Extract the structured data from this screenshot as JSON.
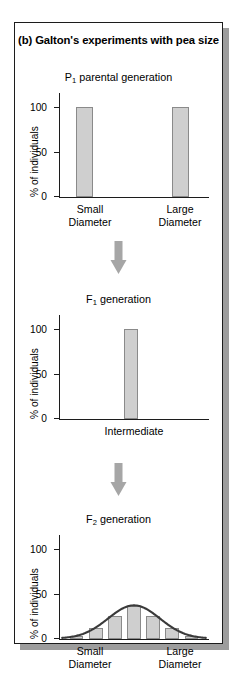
{
  "figure": {
    "title": "(b) Galton's experiments with pea size",
    "title_prefix": "(b)",
    "title_text": "Galton's experiments with pea size"
  },
  "axis": {
    "y_label": "% of individuals",
    "y_ticks": [
      "100",
      "50",
      "0"
    ],
    "y_min": 0,
    "y_max": 115
  },
  "panels": [
    {
      "id": "p1",
      "generation_label_prefix": "P",
      "generation_label_sub": "1",
      "generation_label_suffix": " parental generation",
      "x_categories": [
        "Small\nDiameter",
        "Large\nDiameter"
      ],
      "bar_values": [
        100,
        100
      ]
    },
    {
      "id": "f1",
      "generation_label_prefix": "F",
      "generation_label_sub": "1",
      "generation_label_suffix": " generation",
      "x_categories": [
        "Intermediate"
      ],
      "bar_values": [
        100
      ]
    },
    {
      "id": "f2",
      "generation_label_prefix": "F",
      "generation_label_sub": "2",
      "generation_label_suffix": " generation",
      "x_categories": [
        "Small\nDiameter",
        "Large\nDiameter"
      ],
      "bar_values": [
        3,
        14,
        29,
        41,
        29,
        14,
        3
      ]
    }
  ],
  "colors": {
    "bar_fill": "#cfcfcf",
    "bar_stroke": "#8a8a8a",
    "arrow": "#a6a6a6",
    "axis": "#1c1c1c",
    "curve": "#3a3a3a",
    "frame": "#1c1c1c",
    "shadow": "#9d9d9d"
  },
  "chart_data": [
    {
      "type": "bar",
      "title": "P1 parental generation",
      "xlabel": "",
      "ylabel": "% of individuals",
      "categories": [
        "Small Diameter",
        "Large Diameter"
      ],
      "values": [
        100,
        100
      ],
      "ylim": [
        0,
        115
      ],
      "yticks": [
        0,
        50,
        100
      ],
      "grid": false,
      "legend": "none"
    },
    {
      "type": "bar",
      "title": "F1 generation",
      "xlabel": "",
      "ylabel": "% of individuals",
      "categories": [
        "Intermediate"
      ],
      "values": [
        100
      ],
      "ylim": [
        0,
        115
      ],
      "yticks": [
        0,
        50,
        100
      ],
      "grid": false,
      "legend": "none"
    },
    {
      "type": "bar",
      "title": "F2 generation",
      "xlabel": "",
      "ylabel": "% of individuals",
      "categories": [
        "Small Diameter",
        "",
        "",
        "",
        "",
        "",
        "Large Diameter"
      ],
      "values": [
        3,
        14,
        29,
        41,
        29,
        14,
        3
      ],
      "overlay": {
        "type": "line",
        "name": "normal distribution curve",
        "x": [
          0,
          1,
          2,
          3,
          4,
          5,
          6
        ],
        "values": [
          2,
          13,
          31,
          42,
          31,
          13,
          2
        ]
      },
      "ylim": [
        0,
        115
      ],
      "yticks": [
        0,
        50,
        100
      ],
      "grid": false,
      "legend": "none"
    }
  ]
}
